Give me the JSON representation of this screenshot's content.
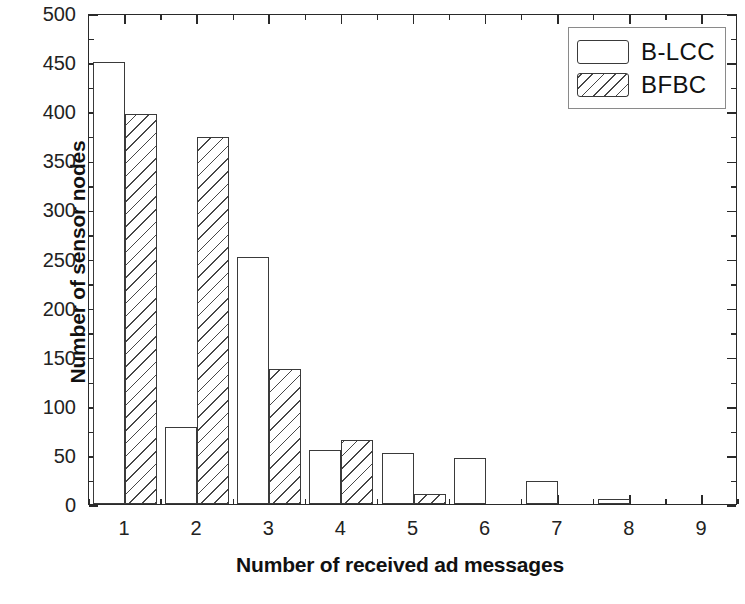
{
  "chart_data": {
    "type": "bar",
    "title": "",
    "xlabel": "Number of received ad messages",
    "ylabel": "Number of sensor nodes",
    "categories": [
      "1",
      "2",
      "3",
      "4",
      "5",
      "6",
      "7",
      "8",
      "9"
    ],
    "series": [
      {
        "name": "B-LCC",
        "fill": "empty",
        "values": [
          450,
          78,
          252,
          55,
          52,
          47,
          23,
          5,
          0
        ]
      },
      {
        "name": "BFBC",
        "fill": "hatched",
        "values": [
          397,
          374,
          137,
          65,
          10,
          0,
          0,
          0,
          0
        ]
      }
    ],
    "xlim": [
      0.5,
      9.5
    ],
    "ylim": [
      0,
      500
    ],
    "ytick_values": [
      0,
      50,
      100,
      150,
      200,
      250,
      300,
      350,
      400,
      450,
      500
    ],
    "ytick_labels": [
      "0",
      "50",
      "100",
      "150",
      "200",
      "250",
      "300",
      "350",
      "400",
      "450",
      "500"
    ],
    "xtick_labels": [
      "1",
      "2",
      "3",
      "4",
      "5",
      "6",
      "7",
      "8",
      "9"
    ],
    "y_minor_step": 25,
    "grid": false,
    "legend_position": "top-right",
    "colors": {
      "axis": "#2a2a2a",
      "bar_edge": "#3a3a3a",
      "bar_fill": "#ffffff",
      "hatch": "#3c3c3c",
      "text": "#111111",
      "background": "#ffffff"
    }
  },
  "legend": {
    "entries": [
      {
        "label": "B-LCC",
        "style": "plain"
      },
      {
        "label": "BFBC",
        "style": "hatch"
      }
    ]
  }
}
